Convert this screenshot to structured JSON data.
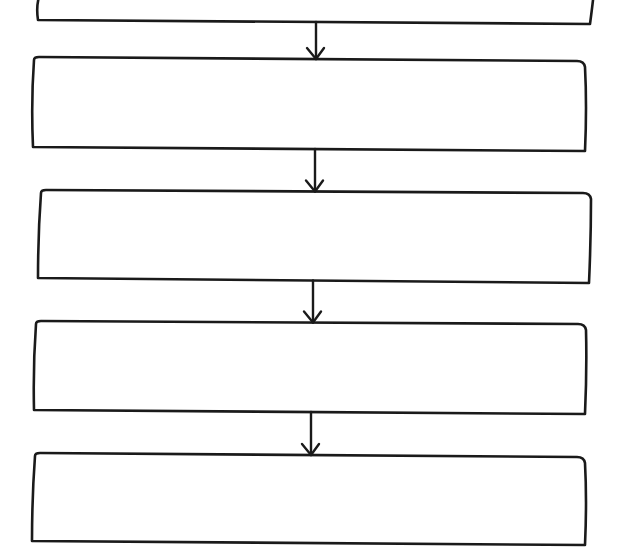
{
  "diagram": {
    "type": "flowchart",
    "direction": "top-to-bottom",
    "style": "hand-drawn",
    "colors": {
      "stroke": "#1a1a1a",
      "box_fill": "#ffffff",
      "background": "#ffffff"
    },
    "nodes": [
      {
        "id": "step-1",
        "label": "",
        "note": "partially cropped at top edge"
      },
      {
        "id": "step-2",
        "label": ""
      },
      {
        "id": "step-3",
        "label": ""
      },
      {
        "id": "step-4",
        "label": ""
      },
      {
        "id": "step-5",
        "label": ""
      }
    ],
    "edges": [
      {
        "from": "step-1",
        "to": "step-2",
        "arrow": "down"
      },
      {
        "from": "step-2",
        "to": "step-3",
        "arrow": "down"
      },
      {
        "from": "step-3",
        "to": "step-4",
        "arrow": "down"
      },
      {
        "from": "step-4",
        "to": "step-5",
        "arrow": "down"
      }
    ]
  }
}
